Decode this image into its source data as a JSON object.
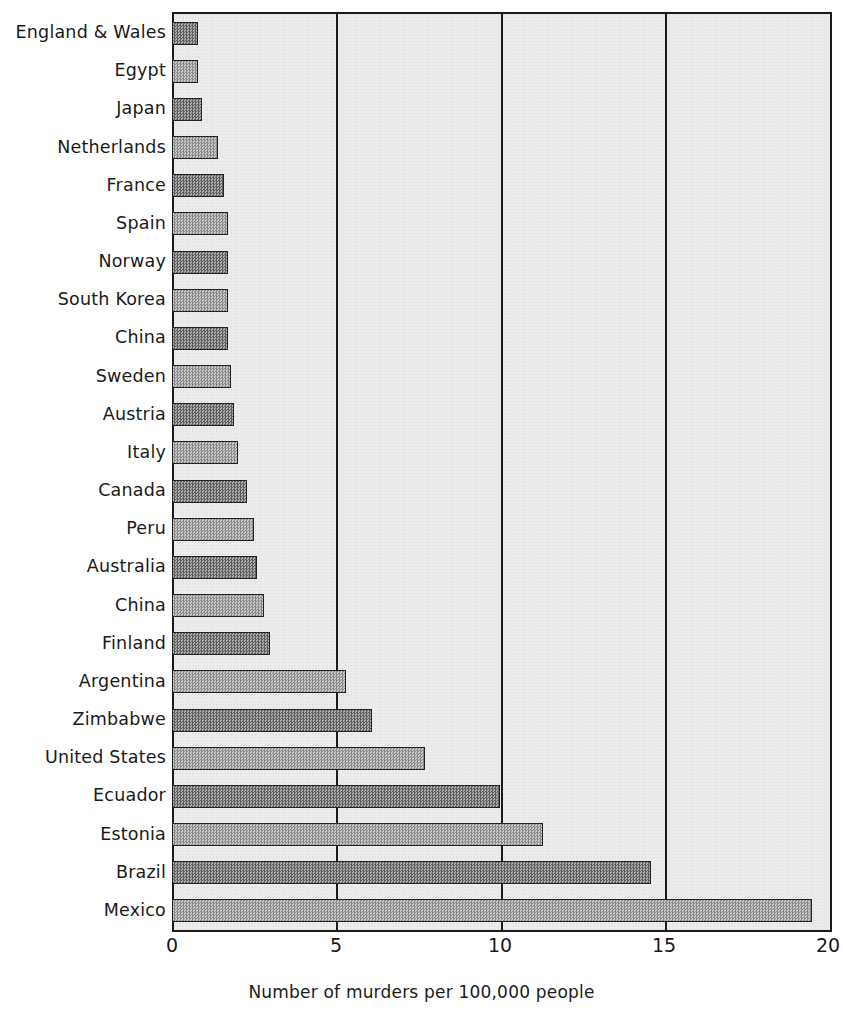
{
  "chart_data": {
    "type": "bar",
    "orientation": "horizontal",
    "title": "",
    "xlabel": "Number of murders per 100,000 people",
    "ylabel": "",
    "xlim": [
      0,
      20
    ],
    "xticks": [
      "0",
      "5",
      "10",
      "15",
      "20"
    ],
    "xtick_values": [
      0,
      5,
      10,
      15,
      20
    ],
    "grid": "vertical gridlines at x = 5, 10, 15",
    "legend": "none",
    "categories": [
      "England & Wales",
      "Egypt",
      "Japan",
      "Netherlands",
      "France",
      "Spain",
      "Norway",
      "South Korea",
      "China",
      "Sweden",
      "Austria",
      "Italy",
      "Canada",
      "Peru",
      "Australia",
      "China",
      "Finland",
      "Argentina",
      "Zimbabwe",
      "United States",
      "Ecuador",
      "Estonia",
      "Brazil",
      "Mexico"
    ],
    "values": [
      0.8,
      0.8,
      0.9,
      1.4,
      1.6,
      1.7,
      1.7,
      1.7,
      1.7,
      1.8,
      1.9,
      2.0,
      2.3,
      2.5,
      2.6,
      2.8,
      3.0,
      5.3,
      6.1,
      7.7,
      10.0,
      11.3,
      14.6,
      19.5
    ]
  },
  "axis": {
    "x_title": "Number of murders per 100,000 people"
  },
  "style": {
    "plot_background": "#ededeb",
    "frame_color": "#1b1b1b",
    "bar_dark": "#5e5e5e",
    "bar_light": "#adadad",
    "text_color": "#1a1a1a"
  }
}
